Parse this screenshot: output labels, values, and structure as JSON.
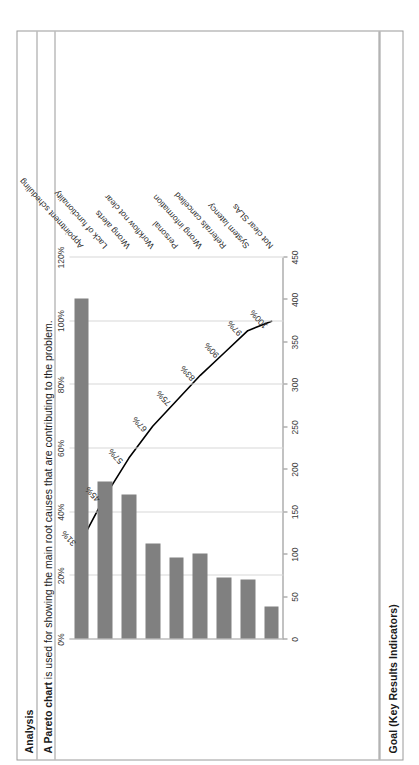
{
  "document": {
    "rows": {
      "analysis_header": "Analysis",
      "analysis_text_bold": "A Pareto chart",
      "analysis_text_rest": " is used for showing the main root causes that are contributing to the problem.",
      "goal_header": "Goal (Key Results Indicators)"
    }
  },
  "chart_data": {
    "type": "bar",
    "title": "",
    "subtitle": "",
    "xlabel": "",
    "ylabel": "",
    "categories": [
      "Appointment scheduling",
      "Lack of functionality",
      "Wrong alerts",
      "Workflow not clear",
      "Personal",
      "Wrong information",
      "Referrals cancelled",
      "System latency",
      "Not clear SLAs"
    ],
    "categories_plotted": [
      "Appointment scheduling",
      "Lack of functionality",
      "Wrong alerts",
      "Workflow not clear",
      "Personal",
      "Wrong information",
      "Referrals cancelled",
      "System latency",
      "Not clear SLAs"
    ],
    "values": [
      400,
      185,
      170,
      112,
      95,
      100,
      72,
      70,
      38
    ],
    "cumulative_percent": [
      31,
      45,
      57,
      67,
      75,
      83,
      90,
      97,
      100
    ],
    "cumulative_labels": [
      "31%",
      "45%",
      "57%",
      "67%",
      "75%",
      "83%",
      "90%",
      "97%",
      "100%"
    ],
    "y_ticks": [
      0,
      50,
      100,
      150,
      200,
      250,
      300,
      350,
      400,
      450
    ],
    "y_tick_labels": [
      "0",
      "50",
      "100",
      "150",
      "200",
      "250",
      "300",
      "350",
      "400",
      "450"
    ],
    "ylim": [
      0,
      450
    ],
    "y2_ticks": [
      0,
      20,
      40,
      60,
      80,
      100,
      120
    ],
    "y2_tick_labels": [
      "0%",
      "20%",
      "40%",
      "60%",
      "80%",
      "100%",
      "120%"
    ],
    "y2lim": [
      0,
      120
    ],
    "grid": true,
    "legend": "none",
    "bar_color": "#808080",
    "line_color": "#000000",
    "gridline_color": "#d7d7d7",
    "axis_color": "#868686"
  }
}
